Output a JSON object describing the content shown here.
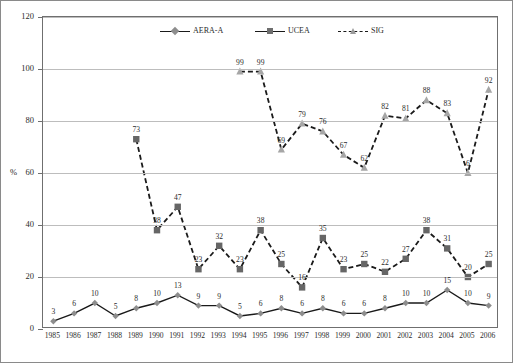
{
  "chart_data": {
    "type": "line",
    "title": "",
    "xlabel": "",
    "ylabel": "%",
    "ylim": [
      0,
      120
    ],
    "ytick_values": [
      0,
      20,
      40,
      60,
      80,
      100,
      120
    ],
    "ytick_labels": [
      "0",
      "20",
      "40",
      "60",
      "80",
      "100",
      "120"
    ],
    "grid": true,
    "legend_position": "top-center",
    "categories": [
      "1985",
      "1986",
      "1987",
      "1988",
      "1989",
      "1990",
      "1991",
      "1992",
      "1993",
      "1994",
      "1995",
      "1996",
      "1997",
      "1998",
      "1999",
      "2000",
      "2001",
      "2002",
      "2003",
      "2004",
      "2005",
      "2006"
    ],
    "series": [
      {
        "name": "AERA-A",
        "marker": "diamond",
        "line_style": "solid",
        "color": "#1a1a1a",
        "marker_color": "#8d8d8d",
        "values": [
          3,
          6,
          10,
          5,
          8,
          10,
          13,
          9,
          9,
          5,
          6,
          8,
          6,
          8,
          6,
          6,
          8,
          10,
          10,
          15,
          10,
          9
        ],
        "labels": [
          "3",
          "6",
          "10",
          "5",
          "8",
          "10",
          "13",
          "9",
          "9",
          "5",
          "6",
          "8",
          "6",
          "8",
          "6",
          "6",
          "8",
          "10",
          "10",
          "15",
          "10",
          "9"
        ]
      },
      {
        "name": "UCEA",
        "marker": "square",
        "line_style": "dashed",
        "color": "#1a1a1a",
        "marker_color": "#666666",
        "values": [
          null,
          null,
          null,
          null,
          73,
          38,
          47,
          23,
          32,
          23,
          38,
          25,
          16,
          35,
          23,
          25,
          22,
          27,
          38,
          31,
          20,
          25
        ],
        "labels": [
          null,
          null,
          null,
          null,
          "73",
          "38",
          "47",
          "23",
          "32",
          "23",
          "38",
          "25",
          "16",
          "35",
          "23",
          "25",
          "22",
          "27",
          "38",
          "31",
          "20",
          "25"
        ]
      },
      {
        "name": "SIG",
        "marker": "triangle",
        "line_style": "dashed",
        "color": "#1a1a1a",
        "marker_color": "#a6a6a6",
        "values": [
          null,
          null,
          null,
          null,
          null,
          null,
          null,
          null,
          null,
          99,
          99,
          69,
          79,
          76,
          67,
          62,
          82,
          81,
          88,
          83,
          60,
          92
        ],
        "labels": [
          null,
          null,
          null,
          null,
          null,
          null,
          null,
          null,
          null,
          "99",
          "99",
          "69",
          "79",
          "76",
          "67",
          "62",
          "82",
          "81",
          "88",
          "83",
          "6",
          "92"
        ]
      }
    ]
  },
  "legend": {
    "items": [
      {
        "label": "AERA-A",
        "marker": "diamond",
        "line_style": "solid"
      },
      {
        "label": "UCEA",
        "marker": "square",
        "line_style": "solid"
      },
      {
        "label": "SIG",
        "marker": "triangle",
        "line_style": "dashed"
      }
    ]
  },
  "axes": {
    "y_unit_label": "%"
  }
}
